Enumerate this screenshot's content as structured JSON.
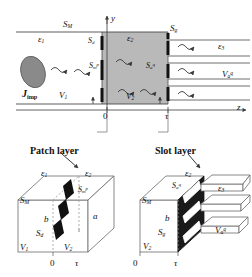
{
  "figure": {
    "type": "technical-diagram",
    "colors": {
      "slab_fill": "#b9b9b9",
      "line": "#4a4a4a",
      "black": "#111111",
      "source_blob": "#8a8a8a",
      "white": "#ffffff"
    }
  },
  "top_diagram": {
    "name": "cross-section-view",
    "axes": {
      "y_label": "y",
      "z_label": "z",
      "origin_label": "0",
      "tau_label": "τ"
    },
    "labels": {
      "s_m": {
        "base": "S",
        "sub": "M"
      },
      "eps1": {
        "base": "ε",
        "sub": "1"
      },
      "s_d": {
        "base": "S",
        "sub": "d"
      },
      "eps2": {
        "base": "ε",
        "sub": "2"
      },
      "s_g": {
        "base": "S",
        "sub": "g"
      },
      "eps3": {
        "base": "ε",
        "sub": "3"
      },
      "s_m_p": {
        "base": "S",
        "sub": "m",
        "sup": "p"
      },
      "s_a_q": {
        "base": "S",
        "sub": "a",
        "sup": "q"
      },
      "v_a_q": {
        "base": "V",
        "sub": "a",
        "sup": "q"
      },
      "v1": {
        "base": "V",
        "sub": "1"
      },
      "v2": {
        "base": "V",
        "sub": "2"
      },
      "j_imp": {
        "base": "J",
        "sub": "imp"
      }
    }
  },
  "patch_layer": {
    "title": "Patch layer",
    "labels": {
      "eps1": {
        "base": "ε",
        "sub": "1"
      },
      "eps2": {
        "base": "ε",
        "sub": "2"
      },
      "s_m": {
        "base": "S",
        "sub": "M"
      },
      "s_m_p": {
        "base": "S",
        "sub": "m",
        "sup": "p"
      },
      "b": {
        "base": "b"
      },
      "a": {
        "base": "a"
      },
      "s_d": {
        "base": "S",
        "sub": "d"
      },
      "v1": {
        "base": "V",
        "sub": "1"
      },
      "v2": {
        "base": "V",
        "sub": "2"
      },
      "origin": "0",
      "tau": "τ"
    }
  },
  "slot_layer": {
    "title": "Slot layer",
    "labels": {
      "eps2": {
        "base": "ε",
        "sub": "2"
      },
      "eps3": {
        "base": "ε",
        "sub": "3"
      },
      "s_a_q": {
        "base": "S",
        "sub": "a",
        "sup": "q"
      },
      "s_m": {
        "base": "S",
        "sub": "M"
      },
      "b": {
        "base": "b"
      },
      "s_g": {
        "base": "S",
        "sub": "g"
      },
      "v2": {
        "base": "V",
        "sub": "2"
      },
      "v_a_q": {
        "base": "V",
        "sub": "a",
        "sup": "q"
      },
      "origin": "0",
      "tau": "τ"
    }
  }
}
